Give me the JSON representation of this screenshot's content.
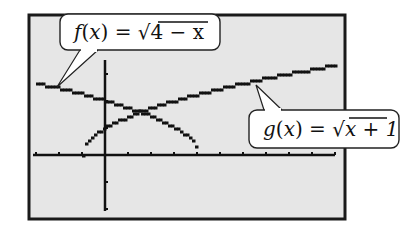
{
  "screen": {
    "frame": {
      "x": 29,
      "y": 15,
      "w": 316,
      "h": 204,
      "stroke": "#1a1a1a",
      "bg": "#e6e6e6"
    },
    "origin_px": {
      "x": 105,
      "y": 155
    },
    "unit_px": {
      "x": 23,
      "y": 27
    }
  },
  "labels": {
    "f": {
      "name": "f",
      "expr": "4 − x",
      "prefix": "f(x) = ",
      "box": {
        "x": 60,
        "y": 14,
        "w": 160,
        "h": 36
      },
      "pointer_to": [
        57,
        87
      ]
    },
    "g": {
      "name": "g",
      "expr": "x + 1",
      "prefix": "g(x) = ",
      "box": {
        "x": 249,
        "y": 110,
        "w": 150,
        "h": 38
      },
      "pointer_to": [
        256,
        85
      ]
    }
  },
  "chart_data": {
    "type": "line",
    "title": "",
    "xlabel": "",
    "ylabel": "",
    "xlim": [
      -3,
      10
    ],
    "ylim": [
      -2,
      5
    ],
    "grid": false,
    "x_ticks": [
      -3,
      -2,
      -1,
      0,
      1,
      2,
      3,
      4,
      5,
      6,
      7,
      8,
      9,
      10
    ],
    "y_ticks": [
      -2,
      -1,
      0,
      1,
      2,
      3
    ],
    "series": [
      {
        "name": "f(x) = √(4 − x)",
        "domain": [
          -3,
          4
        ],
        "x": [
          -3,
          -2,
          -1,
          0,
          1,
          1.5,
          2,
          3,
          3.5,
          4
        ],
        "values": [
          2.65,
          2.45,
          2.24,
          2.0,
          1.73,
          1.58,
          1.41,
          1.0,
          0.71,
          0
        ]
      },
      {
        "name": "g(x) = √(x + 1)",
        "domain": [
          -1,
          10
        ],
        "x": [
          -1,
          -0.5,
          0,
          1,
          1.5,
          2,
          3,
          4,
          5,
          6,
          7,
          8,
          9,
          10
        ],
        "values": [
          0,
          0.71,
          1.0,
          1.41,
          1.58,
          1.73,
          2.0,
          2.24,
          2.45,
          2.65,
          2.83,
          3.0,
          3.16,
          3.32
        ]
      }
    ],
    "annotations": [
      "f(x) = √(4 − x)",
      "g(x) = √(x + 1)"
    ],
    "intersection": {
      "x": 1.5,
      "y": 1.58
    }
  }
}
